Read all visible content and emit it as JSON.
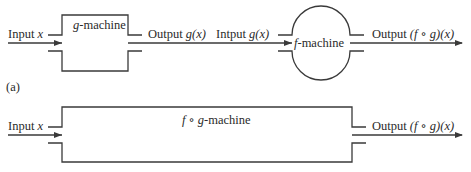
{
  "diagram": {
    "part_a": {
      "label": "(a)",
      "input_label": "Input ",
      "input_var": "x",
      "g_machine": {
        "name_var": "g",
        "name_rest": "-machine"
      },
      "g_output_label": "Output ",
      "g_output_var": "g(x)",
      "f_input_label": "Intput ",
      "f_input_var": "g(x)",
      "f_machine": {
        "name_var": "f",
        "name_rest": "-machine"
      },
      "f_output_label": "Output ",
      "f_output_var": "(f ∘ g)(x)"
    },
    "part_b": {
      "input_label": "Input ",
      "input_var": "x",
      "fg_machine": {
        "name_var": "f ∘ g",
        "name_rest": "-machine"
      },
      "output_label": "Output ",
      "output_var": "(f ∘ g)(x)"
    },
    "colors": {
      "line": "#3a3a3a",
      "text": "#2a2a2a",
      "background": "#ffffff"
    }
  }
}
